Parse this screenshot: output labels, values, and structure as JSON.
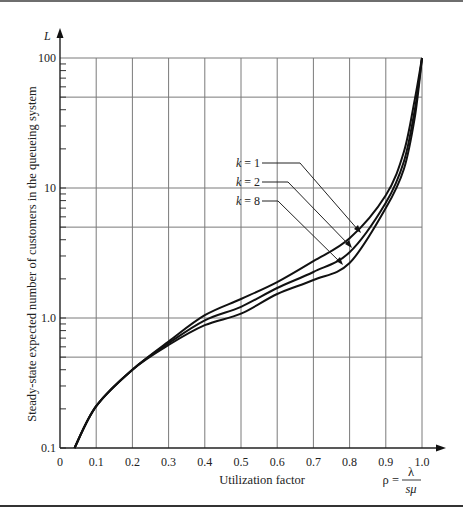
{
  "chart_data": {
    "type": "line",
    "title": "",
    "xlabel": "Utilization factor",
    "xlabel_formula": {
      "lhs": "ρ =",
      "numerator": "λ",
      "denominator": "sμ"
    },
    "ylabel": "Steady-state expected number of customers in the queueing system",
    "y_axis_symbol": "L",
    "yscale": "log",
    "xlim": [
      0,
      1.0
    ],
    "ylim": [
      0.1,
      100
    ],
    "grid": true,
    "x_ticks": [
      "0",
      "0.1",
      "0.2",
      "0.3",
      "0.4",
      "0.5",
      "0.6",
      "0.7",
      "0.8",
      "0.9",
      "1.0"
    ],
    "y_ticks": [
      "0.1",
      "1.0",
      "10",
      "100"
    ],
    "y_gridlines": [
      0.5,
      1,
      5,
      10,
      50,
      100
    ],
    "x": [
      0.04,
      0.1,
      0.2,
      0.3,
      0.4,
      0.5,
      0.6,
      0.7,
      0.8,
      0.9,
      0.95,
      0.98,
      1.0
    ],
    "series": [
      {
        "name": "k = 1",
        "values": [
          0.1,
          0.21,
          0.4,
          0.66,
          1.05,
          1.4,
          1.89,
          2.74,
          4.1,
          8.8,
          19,
          48,
          100
        ]
      },
      {
        "name": "k = 2",
        "values": [
          0.1,
          0.21,
          0.4,
          0.64,
          0.96,
          1.22,
          1.7,
          2.26,
          3.2,
          7.7,
          16,
          40,
          100
        ]
      },
      {
        "name": "k = 8",
        "values": [
          0.1,
          0.21,
          0.4,
          0.62,
          0.88,
          1.08,
          1.53,
          1.96,
          2.65,
          7.0,
          14,
          35,
          100
        ]
      }
    ],
    "legend_position": "inline labels with leader arrows"
  },
  "labels": {
    "legend": [
      {
        "text_k": "k",
        "text_rest": " = 1"
      },
      {
        "text_k": "k",
        "text_rest": " = 2"
      },
      {
        "text_k": "k",
        "text_rest": " = 8"
      }
    ]
  }
}
